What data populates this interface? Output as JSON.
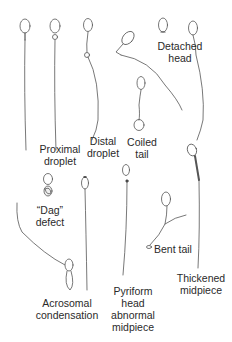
{
  "diagram": {
    "type": "sperm-morphology-illustration",
    "labels": [
      {
        "id": "proximal-droplet",
        "lines": [
          "Proximal",
          "droplet"
        ]
      },
      {
        "id": "distal-droplet",
        "lines": [
          "Distal",
          "droplet"
        ]
      },
      {
        "id": "detached-head",
        "lines": [
          "Detached",
          "head"
        ]
      },
      {
        "id": "coiled-tail",
        "lines": [
          "Coiled",
          "tail"
        ]
      },
      {
        "id": "dag-defect",
        "lines": [
          "“Dag”",
          "defect"
        ]
      },
      {
        "id": "bent-tail",
        "lines": [
          "Bent tail"
        ]
      },
      {
        "id": "thickened-midpiece",
        "lines": [
          "Thickened",
          "midpiece"
        ]
      },
      {
        "id": "acrosomal-condensation",
        "lines": [
          "Acrosomal",
          "condensation"
        ]
      },
      {
        "id": "pyriform-head",
        "lines": [
          "Pyriform",
          "head",
          "abnormal",
          "midpiece"
        ]
      }
    ],
    "stroke_color": "#555555",
    "fill_color": "#ffffff"
  }
}
